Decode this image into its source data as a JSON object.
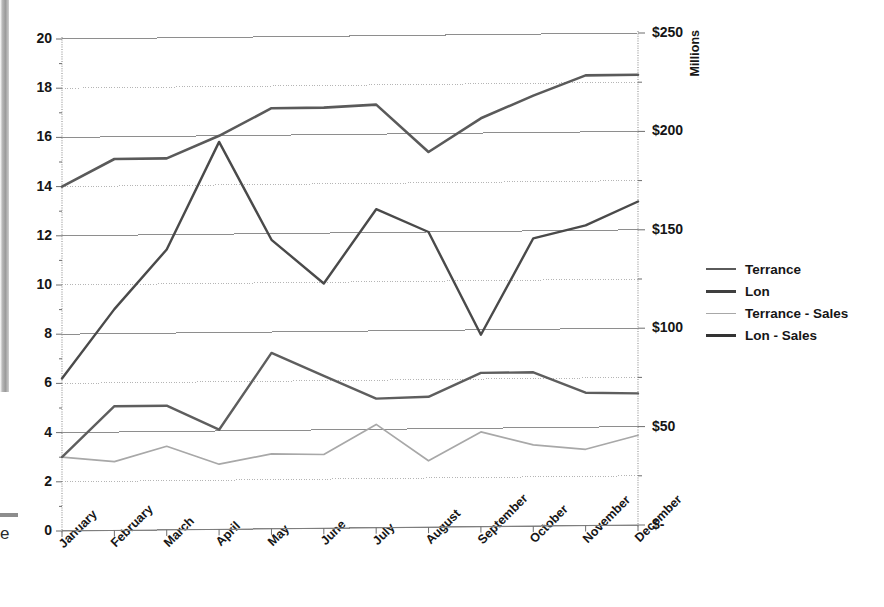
{
  "chart_data": {
    "type": "line",
    "title": "",
    "xlabel": "",
    "categories": [
      "January",
      "February",
      "March",
      "April",
      "May",
      "June",
      "July",
      "August",
      "September",
      "October",
      "November",
      "December"
    ],
    "grid": true,
    "legend_position": "right",
    "left_axis": {
      "label": "",
      "ylim": [
        0,
        20
      ],
      "tick_step": 2,
      "ticks": [
        "0",
        "2",
        "4",
        "6",
        "8",
        "10",
        "12",
        "14",
        "16",
        "18",
        "20"
      ]
    },
    "right_axis": {
      "label": "Millions",
      "ylim": [
        0,
        250
      ],
      "tick_step": 25,
      "ticks": [
        "$-",
        "$50",
        "$100",
        "$150",
        "$200",
        "$250"
      ]
    },
    "series": [
      {
        "name": "Terrance",
        "axis": "left",
        "color": "#5a5a5a",
        "width": 2.6,
        "values": [
          14.0,
          15.1,
          15.1,
          16.0,
          17.1,
          17.1,
          17.2,
          15.25,
          16.6,
          17.5,
          18.3,
          18.3
        ]
      },
      {
        "name": "Lon",
        "axis": "left",
        "color": "#4a4a4a",
        "width": 2.2,
        "values": [
          null,
          null,
          null,
          null,
          null,
          null,
          null,
          null,
          null,
          null,
          null,
          null
        ]
      },
      {
        "name": "Terrance - Sales",
        "axis": "left",
        "color": "#a8a8a8",
        "width": 1.7,
        "values": [
          3.0,
          2.8,
          3.4,
          2.65,
          3.05,
          3.0,
          4.2,
          2.7,
          3.85,
          3.3,
          3.1,
          3.65
        ]
      },
      {
        "name": "Lon - Sales",
        "axis": "left",
        "color": "#4a4a4a",
        "width": 2.4,
        "values": [
          6.2,
          9.0,
          11.4,
          15.75,
          11.75,
          9.95,
          12.95,
          12.0,
          7.8,
          11.7,
          12.2,
          13.15
        ]
      },
      {
        "name": "Lon (lower)",
        "axis": "left",
        "color": "#5e5e5e",
        "width": 2.4,
        "values": [
          3.0,
          5.05,
          5.05,
          4.05,
          7.15,
          6.2,
          5.25,
          5.3,
          6.25,
          6.25,
          5.4,
          5.35
        ]
      }
    ]
  },
  "legend": {
    "items": [
      {
        "label": "Terrance",
        "color": "#5a5a5a",
        "width": 2.6
      },
      {
        "label": "Lon",
        "color": "#3f3f3f",
        "width": 3.0
      },
      {
        "label": "Terrance - Sales",
        "color": "#a8a8a8",
        "width": 1.8
      },
      {
        "label": "Lon - Sales",
        "color": "#333333",
        "width": 3.2
      }
    ]
  },
  "axis_titles": {
    "right": "Millions"
  },
  "scan_artifact": {
    "cropped_text": "e"
  }
}
